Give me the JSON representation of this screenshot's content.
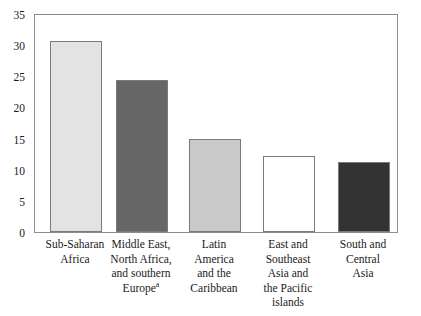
{
  "chart_data": {
    "type": "bar",
    "title": "",
    "subtitle": "",
    "xlabel": "",
    "ylabel": "",
    "ylim": [
      0,
      35
    ],
    "yticks": [
      0,
      5,
      10,
      15,
      20,
      25,
      30,
      35
    ],
    "ytick_labels": [
      "0",
      "5",
      "10",
      "15",
      "20",
      "25",
      "30",
      "35"
    ],
    "grid": false,
    "legend": false,
    "legend_position": "none",
    "categories": [
      "Sub-Saharan Africa",
      "Middle East, North Africa, and southern Europe",
      "Latin America and the Caribbean",
      "East and Southeast Asia and the Pacific islands",
      "South and Central Asia"
    ],
    "values": [
      30.6,
      24.3,
      14.9,
      12.1,
      11.2
    ],
    "annotations": [
      "a"
    ],
    "bar_colors": [
      "#e3e3e3",
      "#666666",
      "#c9c9c9",
      "#ffffff",
      "#333333"
    ]
  },
  "axis": {
    "y_tick_labels": [
      "35",
      "30",
      "25",
      "20",
      "15",
      "10",
      "5",
      "0"
    ]
  },
  "bars": [
    {
      "id": "sub-saharan-africa",
      "value": 30.6,
      "fill": "#e3e3e3",
      "label_lines": [
        "Sub-Saharan",
        "Africa"
      ],
      "footnote": ""
    },
    {
      "id": "middle-east-north-africa-southern-europe",
      "value": 24.3,
      "fill": "#666666",
      "label_lines": [
        "Middle East,",
        "North Africa,",
        "and southern",
        "Europe"
      ],
      "footnote": "a"
    },
    {
      "id": "latin-america-caribbean",
      "value": 14.9,
      "fill": "#c9c9c9",
      "label_lines": [
        "Latin",
        "America",
        "and the",
        "Caribbean"
      ],
      "footnote": ""
    },
    {
      "id": "east-southeast-asia-pacific-islands",
      "value": 12.1,
      "fill": "#ffffff",
      "label_lines": [
        "East and",
        "Southeast",
        "Asia and",
        "the Pacific",
        "islands"
      ],
      "footnote": ""
    },
    {
      "id": "south-central-asia",
      "value": 11.2,
      "fill": "#333333",
      "label_lines": [
        "South and",
        "Central",
        "Asia"
      ],
      "footnote": ""
    }
  ]
}
